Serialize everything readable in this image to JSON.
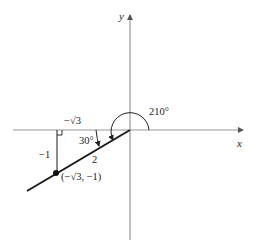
{
  "diagram": {
    "axes": {
      "x_label": "x",
      "y_label": "y"
    },
    "angles": {
      "reference_angle_label": "30°",
      "standard_angle_label": "210°"
    },
    "triangle": {
      "horizontal_leg_label": "−√3",
      "vertical_leg_label": "−1",
      "hypotenuse_label": "2"
    },
    "point": {
      "label": "(−√3,  −1)",
      "x": "−√3",
      "y": "−1"
    },
    "colors": {
      "axis": "#9a9a9a",
      "line": "#1a1a1a",
      "text": "#222222"
    }
  }
}
